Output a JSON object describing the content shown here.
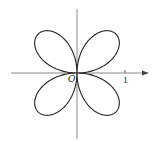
{
  "diagram": {
    "type": "polar-rose-curve",
    "petals": 4,
    "origin_label": "O",
    "x_tick_label": "1",
    "colors": {
      "curve": "#222222",
      "axis": "#888888",
      "background": "#ffffff"
    }
  }
}
